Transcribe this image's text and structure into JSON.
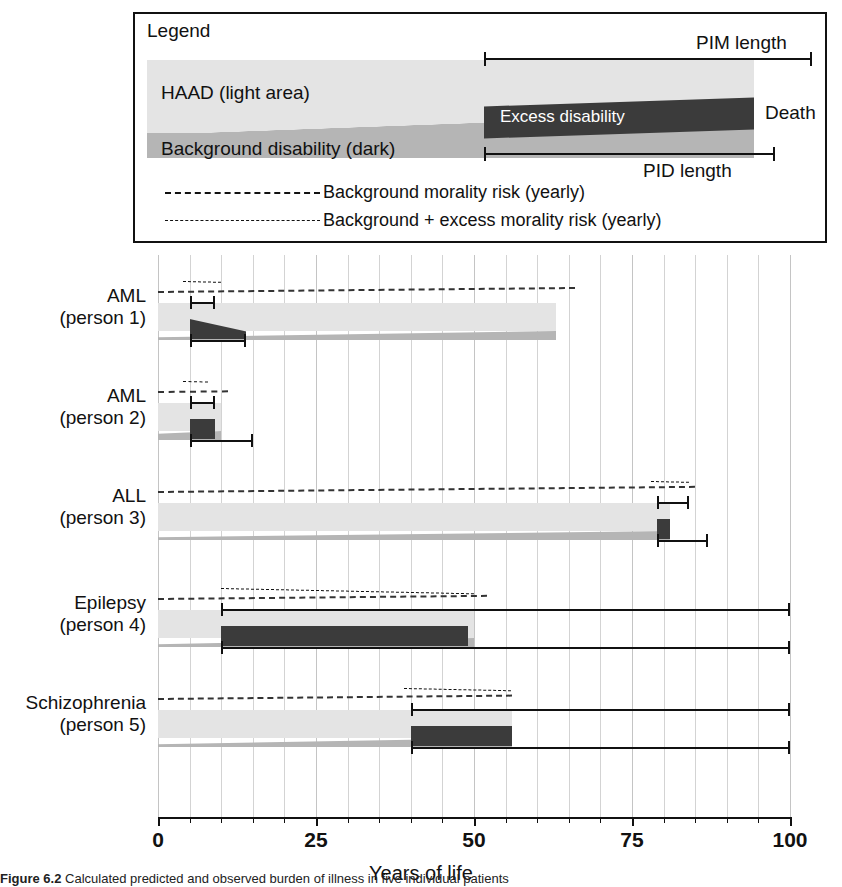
{
  "legend": {
    "title": "Legend",
    "haad_label": "HAAD (light area)",
    "background_disability_label": "Background disability (dark)",
    "excess_label": "Excess disability",
    "death_label": "Death",
    "pim_label": "PIM length",
    "pid_label": "PID length",
    "key_background_risk": "Background morality risk (yearly)",
    "key_total_risk": "Background + excess morality risk (yearly)"
  },
  "colors": {
    "haad_light": "#e4e4e4",
    "background_disability": "#b5b5b5",
    "excess_disability": "#3b3b3b",
    "axis": "#111111",
    "gridline": "#d3d3d3"
  },
  "axis": {
    "title": "Years of life",
    "min": 0,
    "max": 100,
    "tick_step": 5,
    "labels": [
      "0",
      "25",
      "50",
      "75",
      "100"
    ],
    "label_values": [
      0,
      25,
      50,
      75,
      100
    ]
  },
  "caption": {
    "figure_number": "Figure 6.2",
    "text": "Calculated predicted and observed burden of illness in five individual patients"
  },
  "chart_data": {
    "type": "bar",
    "title": "",
    "xlabel": "Years of life",
    "ylabel": "",
    "xlim": [
      0,
      100
    ],
    "grid": true,
    "legend_position": "top-box",
    "categories": [
      "AML (person 1)",
      "AML (person 2)",
      "ALL (person 3)",
      "Epilepsy (person 4)",
      "Schizophrenia (person 5)"
    ],
    "series": [
      {
        "name": "HAAD (light area) end",
        "values": [
          63,
          10,
          81,
          50,
          56
        ]
      },
      {
        "name": "Excess disability start",
        "values": [
          5,
          5,
          79,
          10,
          40
        ]
      },
      {
        "name": "Excess disability end",
        "values": [
          14,
          9,
          81,
          49,
          56
        ]
      },
      {
        "name": "PIM bracket start",
        "values": [
          5,
          5,
          79,
          10,
          40
        ]
      },
      {
        "name": "PIM bracket end",
        "values": [
          9,
          9,
          84,
          100,
          100
        ]
      },
      {
        "name": "PID bracket start",
        "values": [
          5,
          5,
          79,
          10,
          40
        ]
      },
      {
        "name": "PID bracket end",
        "values": [
          14,
          15,
          87,
          100,
          100
        ]
      }
    ],
    "rows": [
      {
        "label_line1": "AML",
        "label_line2": "(person 1)",
        "haad_start": 0,
        "haad_end": 63,
        "excess_start": 5,
        "excess_end": 14,
        "excess_shape": "triangle",
        "pim_start": 5,
        "pim_end": 9,
        "pid_start": 5,
        "pid_end": 14,
        "risk_background_end": 66,
        "risk_total_start": 4,
        "risk_total_end": 10
      },
      {
        "label_line1": "AML",
        "label_line2": "(person 2)",
        "haad_start": 0,
        "haad_end": 10,
        "excess_start": 5,
        "excess_end": 9,
        "excess_shape": "block",
        "pim_start": 5,
        "pim_end": 9,
        "pid_start": 5,
        "pid_end": 15,
        "risk_background_end": 11,
        "risk_total_start": 4,
        "risk_total_end": 8
      },
      {
        "label_line1": "ALL",
        "label_line2": "(person 3)",
        "haad_start": 0,
        "haad_end": 81,
        "excess_start": 79,
        "excess_end": 81,
        "excess_shape": "block",
        "pim_start": 79,
        "pim_end": 84,
        "pid_start": 79,
        "pid_end": 87,
        "risk_background_end": 85,
        "risk_total_start": 78,
        "risk_total_end": 84
      },
      {
        "label_line1": "Epilepsy",
        "label_line2": "(person 4)",
        "haad_start": 0,
        "haad_end": 50,
        "excess_start": 10,
        "excess_end": 49,
        "excess_shape": "block",
        "pim_start": 10,
        "pim_end": 100,
        "pid_start": 10,
        "pid_end": 100,
        "risk_background_end": 52,
        "risk_total_start": 10,
        "risk_total_end": 50
      },
      {
        "label_line1": "Schizophrenia",
        "label_line2": "(person 5)",
        "haad_start": 0,
        "haad_end": 56,
        "excess_start": 40,
        "excess_end": 56,
        "excess_shape": "block",
        "pim_start": 40,
        "pim_end": 100,
        "pid_start": 40,
        "pid_end": 100,
        "risk_background_end": 56,
        "risk_total_start": 39,
        "risk_total_end": 56
      }
    ]
  }
}
